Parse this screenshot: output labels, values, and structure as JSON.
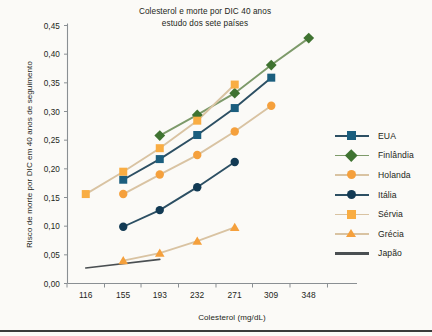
{
  "chart_data": {
    "type": "line",
    "title": "Colesterol  e morte por DIC  40 anos",
    "subtitle": "estudo dos sete países",
    "xlabel": "Colesterol (mg/dL)",
    "ylabel": "Risco de morte por DIC em 40 anos de seguimento",
    "x": [
      116,
      155,
      193,
      232,
      271,
      309,
      348
    ],
    "xtick_labels": [
      "116",
      "155",
      "193",
      "232",
      "271",
      "309",
      "348"
    ],
    "ytick_labels": [
      "0,00",
      "0,05",
      "0,10",
      "0,15",
      "0,20",
      "0,25",
      "0,30",
      "0,35",
      "0,40",
      "0,45"
    ],
    "ytick_values": [
      0.0,
      0.05,
      0.1,
      0.15,
      0.2,
      0.25,
      0.3,
      0.35,
      0.4,
      0.45
    ],
    "xlim": [
      97,
      367
    ],
    "ylim": [
      0.0,
      0.45
    ],
    "grid": false,
    "legend_position": "right",
    "series": [
      {
        "name": "EUA",
        "marker": "square",
        "color": "#1b5e7e",
        "line_color": "#2c4f63",
        "x": [
          155,
          193,
          232,
          271,
          309
        ],
        "values": [
          0.181,
          0.217,
          0.259,
          0.306,
          0.359
        ]
      },
      {
        "name": "Finlândia",
        "marker": "diamond",
        "color": "#3f7331",
        "line_color": "#7d9a6a",
        "x": [
          193,
          232,
          271,
          309,
          348
        ],
        "values": [
          0.258,
          0.294,
          0.332,
          0.381,
          0.428
        ]
      },
      {
        "name": "Holanda",
        "marker": "circle",
        "color": "#f5a03c",
        "line_color": "#d9c3a2",
        "x": [
          155,
          193,
          232,
          271,
          309
        ],
        "values": [
          0.156,
          0.19,
          0.224,
          0.265,
          0.31
        ]
      },
      {
        "name": "Itália",
        "marker": "circle",
        "color": "#123a54",
        "line_color": "#2c4f63",
        "x": [
          155,
          193,
          232,
          271
        ],
        "values": [
          0.099,
          0.128,
          0.168,
          0.212
        ]
      },
      {
        "name": "Sérvia",
        "marker": "square",
        "color": "#f9ad43",
        "line_color": "#d9c3a2",
        "x": [
          116,
          155,
          193,
          232,
          271
        ],
        "values": [
          0.156,
          0.195,
          0.236,
          0.284,
          0.347
        ]
      },
      {
        "name": "Grécia",
        "marker": "triangle",
        "color": "#f5a03c",
        "line_color": "#d9c3a2",
        "x": [
          155,
          193,
          232,
          271
        ],
        "values": [
          0.04,
          0.053,
          0.074,
          0.098
        ]
      },
      {
        "name": "Japão",
        "marker": "none",
        "color": "#5a6268",
        "line_color": "#4a4f52",
        "x": [
          116,
          193
        ],
        "values": [
          0.027,
          0.042
        ]
      }
    ]
  }
}
